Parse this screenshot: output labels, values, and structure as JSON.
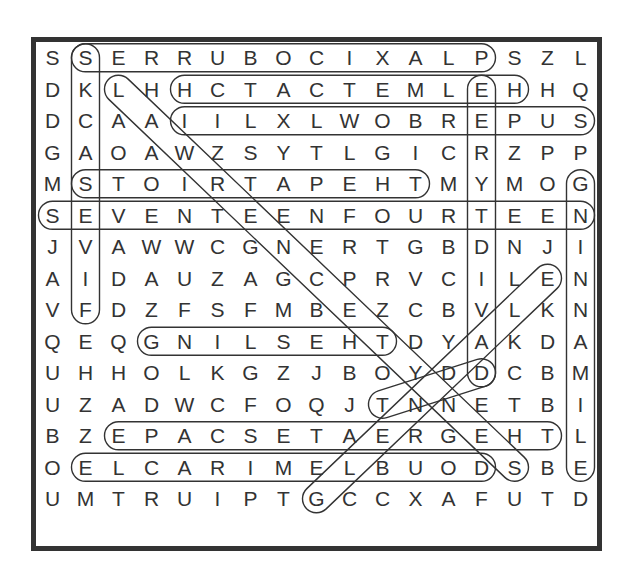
{
  "puzzle": {
    "type": "word-search",
    "rows": 16,
    "cols": 17,
    "grid": [
      "SSERRUBOCIXALPSZL",
      "DKLHHCTACTEMLEHHQ",
      "DCAAIILXLWOBREPUS",
      "GAOAWZSYTLGICRZPP",
      "MSTOIRTAPEHTMYMOG",
      "SEVENTEENFOURTEEN",
      "JVAWWCGNERTGBDNJI",
      "AIDAUZAGCPRVCILEN",
      "VFDZFSFMBEZCBVLKN",
      "QEQGNILSEHTDYAKDA",
      "UHHOLKGZJBOYDDCBM",
      "UZADWCFOQJTNNETBI",
      "BZEPACSETAERGEHTL",
      "OELCARIMELBUODSBE",
      "UMTRUIPTGCCXAFUTD"
    ],
    "found_words": [
      {
        "word": "PLAXICOBURRES",
        "start": [
          0,
          13
        ],
        "end": [
          0,
          1
        ]
      },
      {
        "word": "SKCASSEVIF",
        "start": [
          0,
          1
        ],
        "end": [
          8,
          1
        ]
      },
      {
        "word": "HELMETCATCH",
        "start": [
          1,
          14
        ],
        "end": [
          1,
          4
        ]
      },
      {
        "word": "SUPEREBOWLXLII",
        "start": [
          2,
          16
        ],
        "end": [
          2,
          4
        ]
      },
      {
        "word": "THEPATRIOTS",
        "start": [
          4,
          11
        ],
        "end": [
          4,
          1
        ]
      },
      {
        "word": "SEVENTEENFOURTEEN",
        "start": [
          5,
          0
        ],
        "end": [
          5,
          16
        ]
      },
      {
        "word": "GIANTS",
        "start": [
          4,
          16
        ],
        "end": [
          13,
          16
        ]
      },
      {
        "word": "EERTDIVAD",
        "start": [
          1,
          13
        ],
        "end": [
          10,
          13
        ]
      },
      {
        "word": "THESLING",
        "start": [
          9,
          10
        ],
        "end": [
          9,
          3
        ]
      },
      {
        "word": "THEGREATESCAPE",
        "start": [
          12,
          15
        ],
        "end": [
          12,
          2
        ]
      },
      {
        "word": "DOUBLEMIRACLE",
        "start": [
          13,
          13
        ],
        "end": [
          13,
          1
        ]
      },
      {
        "word": "LAWRENCETYNES",
        "start": [
          1,
          2
        ],
        "end": [
          13,
          14
        ]
      },
      {
        "word": "GLENDALE",
        "start": [
          14,
          8
        ],
        "end": [
          7,
          15
        ]
      },
      {
        "word": "TENNEDY",
        "start": [
          11,
          10
        ],
        "end": [
          10,
          13
        ]
      }
    ]
  }
}
